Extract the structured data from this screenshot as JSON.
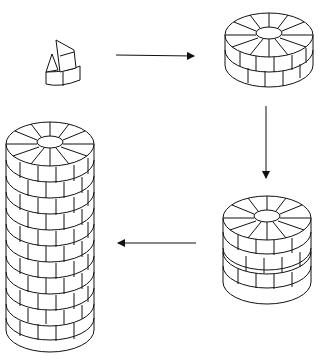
{
  "diagram": {
    "stages": [
      {
        "id": "blocks",
        "label": "",
        "position": "top-left"
      },
      {
        "id": "single-ring",
        "label": "",
        "position": "top-right"
      },
      {
        "id": "double-ring",
        "label": "",
        "position": "bottom-right"
      },
      {
        "id": "tower",
        "label": "",
        "position": "bottom-left"
      }
    ],
    "arrows": [
      {
        "from": "blocks",
        "to": "single-ring",
        "direction": "right"
      },
      {
        "from": "single-ring",
        "to": "double-ring",
        "direction": "down"
      },
      {
        "from": "double-ring",
        "to": "tower",
        "direction": "left"
      }
    ],
    "colors": {
      "line": "#111111",
      "background": "#ffffff"
    }
  }
}
